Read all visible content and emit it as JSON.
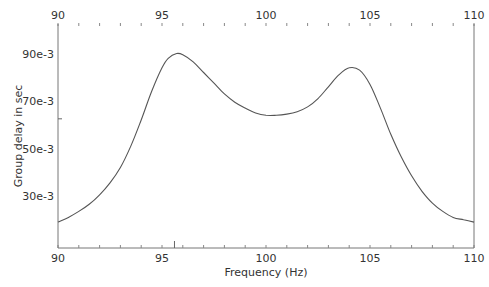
{
  "chart_data": {
    "type": "line",
    "title": "",
    "xlabel": "Frequency (Hz)",
    "ylabel": "Group delay in sec",
    "xlim": [
      90,
      110
    ],
    "ylim": [
      8,
      102
    ],
    "y_unit_scale": "1e-3",
    "x_ticks": [
      90,
      95,
      100,
      105,
      110
    ],
    "x_tick_labels": [
      "90",
      "95",
      "100",
      "105",
      "110"
    ],
    "x_minor_step": 1,
    "y_ticks": [
      30,
      50,
      70,
      90
    ],
    "y_tick_labels": [
      "30e-3",
      "50e-3",
      "70e-3",
      "90e-3"
    ],
    "grid": false,
    "legend": null,
    "markers": {
      "x_axis_marker": 95.6,
      "y_axis_marker": 62.5
    },
    "series": [
      {
        "name": "group delay",
        "color": "#555555",
        "x": [
          90,
          90.5,
          91,
          91.5,
          92,
          92.5,
          93,
          93.5,
          94,
          94.5,
          95,
          95.3,
          95.7,
          96,
          96.5,
          97,
          97.5,
          98,
          98.5,
          99,
          99.5,
          100,
          100.5,
          101,
          101.5,
          102,
          102.5,
          103,
          103.5,
          104,
          104.5,
          105,
          105.5,
          106,
          106.5,
          107,
          107.5,
          108,
          108.5,
          109,
          109.5,
          110
        ],
        "y": [
          19,
          21,
          23.5,
          26.5,
          30.5,
          35.5,
          42,
          51,
          62,
          74,
          84,
          88,
          90,
          89.5,
          86.5,
          82,
          77.5,
          73,
          69.5,
          67,
          65,
          64,
          64,
          64.5,
          65.5,
          67.5,
          71,
          76,
          81,
          84,
          83,
          77,
          67,
          56,
          46.5,
          38.5,
          32,
          27,
          23.5,
          21,
          20,
          19
        ]
      }
    ]
  }
}
